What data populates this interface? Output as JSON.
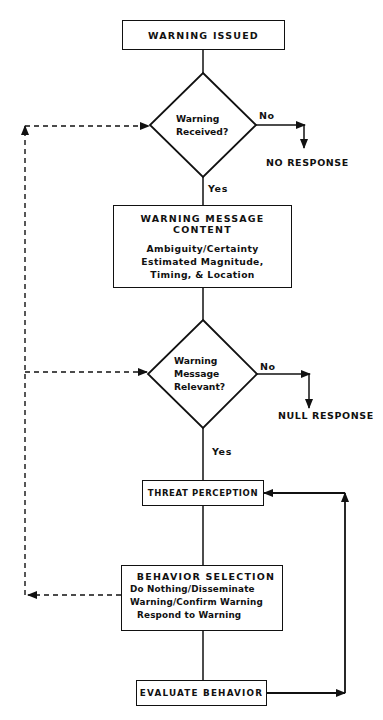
{
  "diagram": {
    "type": "flowchart",
    "nodes": {
      "warning_issued": {
        "title": "WARNING ISSUED"
      },
      "decision_received": {
        "lines": [
          "Warning",
          "Received?"
        ]
      },
      "no_response": {
        "label": "NO RESPONSE"
      },
      "message_content": {
        "title": "WARNING MESSAGE CONTENT",
        "lines": [
          "Ambiguity/Certainty",
          "Estimated Magnitude,",
          "Timing, & Location"
        ]
      },
      "decision_relevant": {
        "lines": [
          "Warning",
          "Message",
          "Relevant?"
        ]
      },
      "null_response": {
        "label": "NULL RESPONSE"
      },
      "threat_perception": {
        "title": "THREAT PERCEPTION"
      },
      "behavior_selection": {
        "title": "BEHAVIOR SELECTION",
        "lines": [
          "Do Nothing/Disseminate",
          "Warning/Confirm Warning",
          "Respond to Warning"
        ]
      },
      "evaluate_behavior": {
        "title": "EVALUATE BEHAVIOR"
      }
    },
    "edge_labels": {
      "received_no": "No",
      "received_yes": "Yes",
      "relevant_no": "No",
      "relevant_yes": "Yes"
    },
    "colors": {
      "ink": "#111111",
      "background": "#ffffff"
    }
  }
}
